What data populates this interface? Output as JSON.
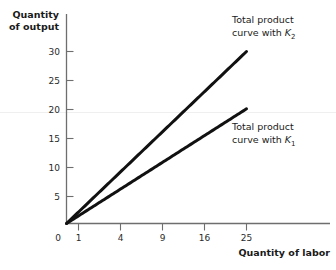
{
  "chart_data": {
    "type": "line",
    "title": "",
    "xlabel": "Quantity of labor",
    "ylabel": "Quantity of output",
    "x_ticks": [
      0,
      1,
      4,
      9,
      16,
      25
    ],
    "x_tick_labels": [
      "0",
      "1",
      "4",
      "9",
      "16",
      "25"
    ],
    "y_ticks": [
      5,
      10,
      15,
      20,
      25,
      30
    ],
    "y_tick_labels": [
      "5",
      "10",
      "15",
      "20",
      "25",
      "30"
    ],
    "xlim": [
      0,
      27
    ],
    "ylim": [
      0,
      33
    ],
    "x_scale": "sqrt",
    "grid": false,
    "legend_position": "inline-annotations",
    "series": [
      {
        "name": "Total product curve with K2",
        "label_line1": "Total product",
        "label_line2_prefix": "curve with ",
        "label_line2_symbol": "K",
        "label_line2_subscript": "2",
        "color": "#111111",
        "x": [
          0,
          0.25,
          1,
          2.25,
          4,
          6.25,
          9,
          12.25,
          16,
          20.25,
          25
        ],
        "y": [
          0,
          3.0,
          6.0,
          9.0,
          12.0,
          15.0,
          18.0,
          21.0,
          24.0,
          27.0,
          30.0
        ]
      },
      {
        "name": "Total product curve with K1",
        "label_line1": "Total product",
        "label_line2_prefix": "curve with ",
        "label_line2_symbol": "K",
        "label_line2_subscript": "1",
        "color": "#111111",
        "x": [
          0,
          0.25,
          1,
          2.25,
          4,
          6.25,
          9,
          12.25,
          16,
          20.25,
          25
        ],
        "y": [
          0,
          2.0,
          4.0,
          6.0,
          8.0,
          10.0,
          12.0,
          14.0,
          16.0,
          18.0,
          20.0
        ]
      }
    ],
    "annotations": [
      {
        "text": "Total product curve with K2",
        "anchor_series": 0
      },
      {
        "text": "Total product curve with K1",
        "anchor_series": 1
      }
    ]
  },
  "axes": {
    "y_title_line1": "Quantity",
    "y_title_line2": "of output",
    "x_title": "Quantity of labor"
  },
  "colors": {
    "curve": "#111111",
    "axis": "#6e6e6e",
    "text": "#1a1a1a",
    "faint_rule": "#efefef",
    "background": "#ffffff"
  }
}
